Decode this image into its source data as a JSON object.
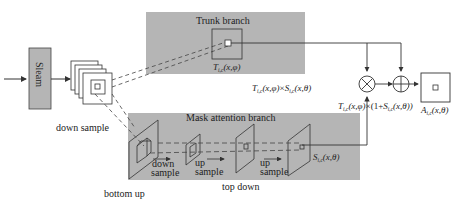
{
  "diagram": {
    "colors": {
      "branch_fill": "#b5b5b5",
      "line": "#333333",
      "box_fill": "#ffffff",
      "stream_fill": "#b5b5b5"
    },
    "input_block": {
      "label": "Sleam"
    },
    "feature_map": {
      "label": "feature map"
    },
    "labels": {
      "down_sample_left": "down sample",
      "bottom_up": "bottom up",
      "top_down": "top down",
      "trunk_branch": "Trunk branch",
      "mask_branch": "Mask attention branch",
      "down_sample_1": "down",
      "down_sample_2": "sample",
      "up_sample_a1": "up",
      "up_sample_a2": "sample",
      "up_sample_b1": "up",
      "up_sample_b2": "sample"
    },
    "math": {
      "trunk_output": {
        "base": "T",
        "sub": "i,c",
        "args": "(x,φ)"
      },
      "mask_output": {
        "base": "S",
        "sub": "i,c",
        "args": "(x,θ)"
      },
      "product": {
        "t": "T",
        "t_sub": "i,c",
        "t_args": "(x,φ)",
        "times": "×",
        "s": "S",
        "s_sub": "i,c",
        "s_args": "(x,θ)"
      },
      "residual": {
        "t": "T",
        "t_sub": "i,c",
        "t_args": "(x,φ)",
        "mid": "×(1+",
        "s": "S",
        "s_sub": "i,c",
        "s_args": "(x,θ))"
      },
      "attention_output": {
        "base": "A",
        "sub": "i,c",
        "args": "(x,θ)"
      }
    },
    "operators": {
      "multiply": "⊗",
      "add": "⊕"
    }
  }
}
